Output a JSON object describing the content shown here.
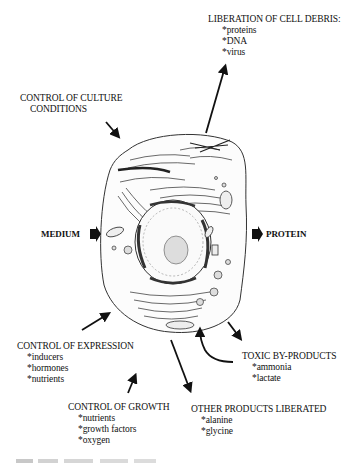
{
  "diagram": {
    "center": "cell",
    "labels": {
      "cell_debris": {
        "title": "LIBERATION OF CELL DEBRIS:",
        "items": [
          "*proteins",
          "*DNA",
          "*virus"
        ]
      },
      "culture": {
        "title_line1": "CONTROL OF CULTURE",
        "title_line2": "CONDITIONS"
      },
      "medium": "MEDIUM",
      "protein": "PROTEIN",
      "expression": {
        "title": "CONTROL OF EXPRESSION",
        "items": [
          "*inducers",
          "*hormones",
          "*nutrients"
        ]
      },
      "toxic": {
        "title": "TOXIC BY-PRODUCTS",
        "items": [
          "*ammonia",
          "*lactate"
        ]
      },
      "growth": {
        "title": "CONTROL OF GROWTH",
        "items": [
          "*nutrients",
          "*growth factors",
          "*oxygen"
        ]
      },
      "other_products": {
        "title": "OTHER PRODUCTS LIBERATED",
        "items": [
          "*alanine",
          "*glycine"
        ]
      }
    }
  }
}
